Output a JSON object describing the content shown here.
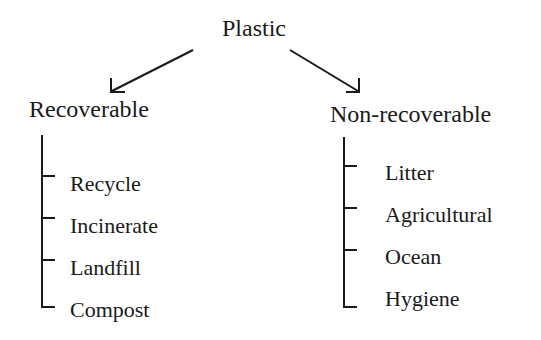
{
  "diagram": {
    "root": {
      "label": "Plastic"
    },
    "branches": [
      {
        "label": "Recoverable",
        "items": [
          "Recycle",
          "Incinerate",
          "Landfill",
          "Compost"
        ]
      },
      {
        "label": "Non-recoverable",
        "items": [
          "Litter",
          "Agricultural",
          "Ocean",
          "Hygiene"
        ]
      }
    ],
    "colors": {
      "line": "#1a1a1a",
      "text": "#1a1a1a",
      "background": "#ffffff"
    }
  }
}
